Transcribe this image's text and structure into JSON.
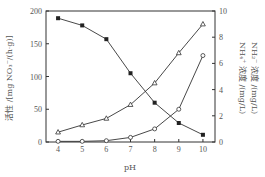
{
  "chart_data": {
    "type": "line",
    "title": "",
    "xlabel": "pH",
    "ylabel_left": "活性 /[mg NO₃⁻/(h·g)]",
    "ylabel_right": [
      "NH₄⁺ 浓度 /(mg/L)",
      "NH₂⁻ 浓度 /(mg/L)"
    ],
    "x": [
      4,
      5,
      6,
      7,
      8,
      9,
      10
    ],
    "xlim": [
      3.5,
      10.5
    ],
    "ylim_left": [
      0,
      200
    ],
    "ylim_right": [
      0,
      10
    ],
    "xticks": [
      "4",
      "5",
      "6",
      "7",
      "8",
      "9",
      "10"
    ],
    "yticks_left": [
      "0",
      "50",
      "100",
      "150",
      "200"
    ],
    "yticks_right": [
      "0",
      "2",
      "4",
      "6",
      "8",
      "10"
    ],
    "grid": false,
    "legend": "none",
    "series": [
      {
        "name": "活性",
        "axis": "left",
        "marker": "filled-square",
        "values": [
          189,
          178,
          157,
          105,
          60,
          29,
          11
        ]
      },
      {
        "name": "NH₄⁺ 浓度",
        "axis": "right",
        "marker": "open-triangle",
        "values": [
          0.75,
          1.3,
          1.8,
          2.85,
          4.5,
          6.8,
          9.0
        ]
      },
      {
        "name": "NH₂⁻ 浓度",
        "axis": "right",
        "marker": "open-circle",
        "values": [
          0.05,
          0.05,
          0.1,
          0.35,
          1.0,
          2.5,
          6.6
        ]
      }
    ]
  }
}
